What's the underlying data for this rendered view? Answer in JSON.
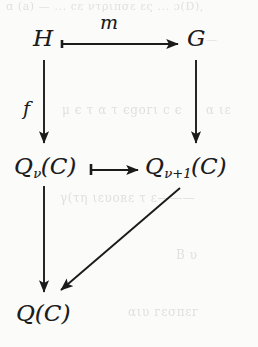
{
  "figure": {
    "kind": "commutative-diagram",
    "caption": "",
    "background_color": "#fbfbfa",
    "ink_color": "#1b1b1b",
    "ghost_color": "#dedede"
  },
  "nodes": [
    {
      "id": "H",
      "base": "H",
      "sub": "",
      "suffix": "",
      "x": 33,
      "y": 27
    },
    {
      "id": "G",
      "base": "G",
      "sub": "",
      "suffix": "",
      "x": 187,
      "y": 27
    },
    {
      "id": "Qv",
      "base": "Q",
      "sub": "ν",
      "suffix": "(C)",
      "x": 14,
      "y": 155
    },
    {
      "id": "Qv1",
      "base": "Q",
      "sub": "ν+1",
      "suffix": "(C)",
      "x": 145,
      "y": 155
    },
    {
      "id": "Q",
      "base": "Q",
      "sub": "",
      "suffix": "(C)",
      "x": 16,
      "y": 302
    }
  ],
  "arrows": [
    {
      "id": "m",
      "from": "H",
      "to": "G",
      "label": "m",
      "style": "mono",
      "direction": "right"
    },
    {
      "id": "f",
      "from": "H",
      "to": "Qv",
      "label": "f",
      "style": "plain",
      "direction": "down"
    },
    {
      "id": "right",
      "from": "G",
      "to": "Qv1",
      "label": "",
      "style": "plain",
      "direction": "down"
    },
    {
      "id": "middle",
      "from": "Qv",
      "to": "Qv1",
      "label": "",
      "style": "mono",
      "direction": "right"
    },
    {
      "id": "left",
      "from": "Qv",
      "to": "Q",
      "label": "",
      "style": "plain",
      "direction": "down"
    },
    {
      "id": "diag",
      "from": "Qv1",
      "to": "Q",
      "label": "",
      "style": "plain",
      "direction": "diagonal-down-left"
    }
  ],
  "labels": {
    "m": "m",
    "f": "f"
  },
  "ghost_text": {
    "line1": "ɑ (a) —  ...   cε ντριπσε ες  ... ɔ(D),",
    "line2": "—",
    "line3": "μ  є  τ  α  τ  єgoгι  c  є",
    "line4": "α  ιε",
    "line5": "γ(τη  ιευοʀε τ ε———",
    "line6": "Β  υ",
    "line7": "αιυ  гεσπεг"
  }
}
